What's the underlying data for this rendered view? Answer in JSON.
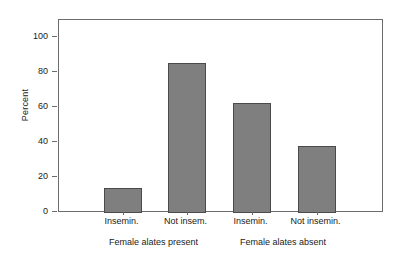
{
  "chart_data": {
    "type": "bar",
    "title": "",
    "subtitle": "",
    "xlabel": "",
    "ylabel": "Percent",
    "categories": [
      "Insemin.",
      "Not insem.",
      "Insemin.",
      "Not insemin."
    ],
    "values": [
      14.5,
      85.5,
      62.5,
      38.0
    ],
    "ylim": [
      0,
      110
    ],
    "yticks": [
      0,
      20,
      40,
      60,
      80,
      100
    ],
    "ytick_labels": [
      "0",
      "20",
      "40",
      "60",
      "80",
      "100"
    ],
    "grid": false,
    "legend": "none",
    "groups": [
      {
        "label": "Female alates present",
        "categories": [
          "Insemin.",
          "Not insem."
        ]
      },
      {
        "label": "Female alates absent",
        "categories": [
          "Insemin.",
          "Not insemin."
        ]
      }
    ],
    "bar_color": "#7f7f7f",
    "bar_edge_color": "#4a4a4a",
    "axis_color": "#6b6b6b",
    "background": "#ffffff"
  },
  "axis": {
    "y_title": "Percent",
    "ticks": [
      {
        "value": "100"
      },
      {
        "value": "80"
      },
      {
        "value": "60"
      },
      {
        "value": "40"
      },
      {
        "value": "20"
      },
      {
        "value": "0"
      }
    ]
  },
  "bars": [
    {
      "label": "Insemin.",
      "value": "14.5"
    },
    {
      "label": "Not insem.",
      "value": "85.5"
    },
    {
      "label": "Insemin.",
      "value": "62.5"
    },
    {
      "label": "Not insemin.",
      "value": "38.0"
    }
  ],
  "groups": [
    {
      "label": "Female alates present"
    },
    {
      "label": "Female alates absent"
    }
  ]
}
